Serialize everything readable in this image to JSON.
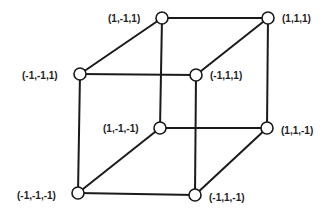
{
  "diagram": {
    "title": "",
    "type": "cube-graph",
    "colors": {
      "line": "#1a1a1a",
      "node_fill": "#ffffff",
      "text": "#222222"
    },
    "nodes": [
      {
        "id": "n_p_m_p",
        "label": "(1,-1,1)",
        "x": 162,
        "y": 18,
        "label_x": 108,
        "label_y": 18,
        "anchor": "start"
      },
      {
        "id": "n_p_p_p",
        "label": "(1,1,1)",
        "x": 268,
        "y": 18,
        "label_x": 282,
        "label_y": 18,
        "anchor": "start"
      },
      {
        "id": "n_m_m_p",
        "label": "(-1,-1,1)",
        "x": 80,
        "y": 74,
        "label_x": 22,
        "label_y": 75,
        "anchor": "start"
      },
      {
        "id": "n_m_p_p",
        "label": "(-1,1,1)",
        "x": 196,
        "y": 75,
        "label_x": 210,
        "label_y": 75,
        "anchor": "start"
      },
      {
        "id": "n_p_m_m",
        "label": "(1,-1,-1)",
        "x": 160,
        "y": 128,
        "label_x": 103,
        "label_y": 128,
        "anchor": "start"
      },
      {
        "id": "n_p_p_m",
        "label": "(1,1,-1)",
        "x": 267,
        "y": 128,
        "label_x": 281,
        "label_y": 130,
        "anchor": "start"
      },
      {
        "id": "n_m_m_m",
        "label": "(-1,-1,-1)",
        "x": 78,
        "y": 193,
        "label_x": 17,
        "label_y": 195,
        "anchor": "start"
      },
      {
        "id": "n_m_p_m",
        "label": "(-1,1,-1)",
        "x": 195,
        "y": 195,
        "label_x": 209,
        "label_y": 197,
        "anchor": "start"
      }
    ],
    "edges": [
      [
        "n_m_m_p",
        "n_p_m_p"
      ],
      [
        "n_p_m_p",
        "n_p_p_p"
      ],
      [
        "n_m_m_p",
        "n_m_p_p"
      ],
      [
        "n_m_p_p",
        "n_p_p_p"
      ],
      [
        "n_m_m_p",
        "n_m_m_m"
      ],
      [
        "n_p_m_p",
        "n_p_m_m"
      ],
      [
        "n_p_p_p",
        "n_p_p_m"
      ],
      [
        "n_m_p_p",
        "n_m_p_m"
      ],
      [
        "n_m_m_m",
        "n_p_m_m"
      ],
      [
        "n_p_m_m",
        "n_p_p_m"
      ],
      [
        "n_m_m_m",
        "n_m_p_m"
      ],
      [
        "n_m_p_m",
        "n_p_p_m"
      ]
    ]
  }
}
